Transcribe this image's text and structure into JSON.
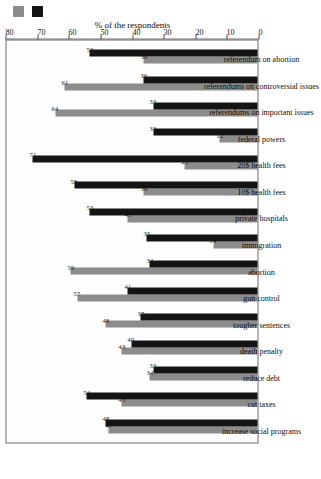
{
  "legend": {
    "series": [
      {
        "name": "series-1",
        "color": "#8c8c8c",
        "label": ""
      },
      {
        "name": "series-2",
        "color": "#141414",
        "label": ""
      }
    ]
  },
  "chart_data": {
    "type": "bar",
    "title": "",
    "subtitle": "",
    "orientation": "vertical-bars-rotated-canvas",
    "xlabel": "",
    "ylabel": "% of the respondents",
    "ylim": [
      0,
      80
    ],
    "yticks": [
      0,
      10,
      20,
      30,
      40,
      50,
      60,
      70,
      80
    ],
    "grid": false,
    "legend_position": "top-left",
    "categories": [
      "increase social programs",
      "cut taxes",
      "reduce debt",
      "death penalty",
      "tougher sentences",
      "gun control",
      "abortion",
      "immigration",
      "private hospitals",
      "10$ health fees",
      "20$ health fees",
      "federal powers",
      "referendums on important issues",
      "referendums on controversial issues",
      "referendum on abortion"
    ],
    "series": [
      {
        "name": "series-1",
        "color": "#8c8c8c",
        "values": [
          47,
          43,
          34,
          43,
          48,
          57,
          59,
          14,
          41,
          36,
          23,
          12,
          64,
          61,
          36
        ]
      },
      {
        "name": "series-2",
        "color": "#141414",
        "values": [
          48,
          54,
          33,
          40,
          37,
          41,
          34,
          35,
          53,
          58,
          71,
          33,
          33,
          36,
          53
        ]
      }
    ]
  }
}
